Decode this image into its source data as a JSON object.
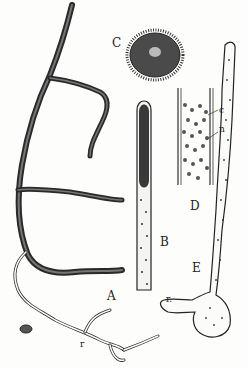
{
  "figure": {
    "panels": [
      {
        "id": "A",
        "label": "A",
        "description": "branching hypha with rhizoid r"
      },
      {
        "id": "B",
        "label": "B",
        "description": "hyphal tip with dense sporangium"
      },
      {
        "id": "C",
        "label": "C",
        "description": "spiny oval spore"
      },
      {
        "id": "D",
        "label": "D",
        "description": "section of hypha with granules"
      },
      {
        "id": "E",
        "label": "E",
        "description": "germinating spore with rhizoid r"
      }
    ],
    "annotations": {
      "r_A": "r",
      "r_E": "r.",
      "c": "c",
      "n": "n"
    },
    "colors": {
      "ink": "#222222",
      "paper": "#fdfdfb"
    }
  }
}
